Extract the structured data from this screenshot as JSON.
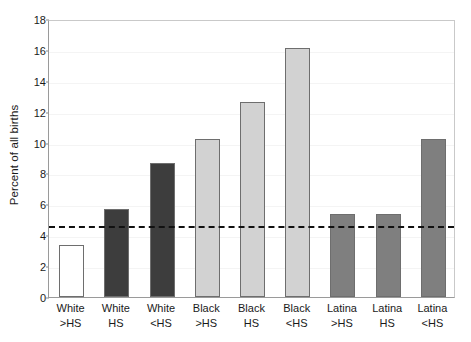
{
  "chart_data": {
    "type": "bar",
    "title": "",
    "xlabel": "",
    "ylabel": "Percent of all births",
    "ylim": [
      0,
      18
    ],
    "ytick_step": 2,
    "yticks": [
      0,
      2,
      4,
      6,
      8,
      10,
      12,
      14,
      16,
      18
    ],
    "ytick_labels": [
      "0",
      "2",
      "4",
      "6",
      "8",
      "10",
      "12",
      "14",
      "16",
      "18"
    ],
    "grid": true,
    "legend": "none",
    "categories": [
      "White >HS",
      "White HS",
      "White <HS",
      "Black >HS",
      "Black HS",
      "Black <HS",
      "Latina >HS",
      "Latina HS",
      "Latina <HS"
    ],
    "category_lines": [
      [
        "White",
        ">HS"
      ],
      [
        "White",
        "HS"
      ],
      [
        "White",
        "<HS"
      ],
      [
        "Black",
        ">HS"
      ],
      [
        "Black",
        "HS"
      ],
      [
        "Black",
        "<HS"
      ],
      [
        "Latina",
        ">HS"
      ],
      [
        "Latina",
        "HS"
      ],
      [
        "Latina",
        "<HS"
      ]
    ],
    "values": [
      3.4,
      5.7,
      8.65,
      10.2,
      12.6,
      16.15,
      5.4,
      5.35,
      10.2
    ],
    "bar_colors": [
      "#ffffff",
      "#3d3d3d",
      "#3d3d3d",
      "#d2d2d2",
      "#d2d2d2",
      "#d2d2d2",
      "#7f7f7f",
      "#7f7f7f",
      "#7f7f7f"
    ],
    "bar_edge_color": "#6e6e6e",
    "reference_line": {
      "value": 4.7,
      "style": "dashed",
      "color": "#111111"
    }
  }
}
